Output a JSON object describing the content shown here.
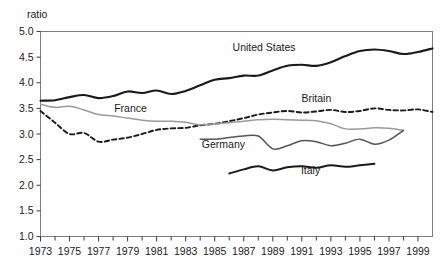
{
  "chart_data": {
    "type": "line",
    "title": "",
    "subtitle": "",
    "xlabel": "",
    "ylabel": "ratio",
    "ylabel_position": "top-left",
    "xlim": [
      1973,
      2000
    ],
    "ylim": [
      1.0,
      5.0
    ],
    "grid": false,
    "legend": "inline-annotations",
    "y_ticks": [
      "1.0",
      "1.5",
      "2.0",
      "2.5",
      "3.0",
      "3.5",
      "4.0",
      "4.5",
      "5.0"
    ],
    "y_tick_values": [
      1.0,
      1.5,
      2.0,
      2.5,
      3.0,
      3.5,
      4.0,
      4.5,
      5.0
    ],
    "x_ticks_major": [
      "1973",
      "1975",
      "1977",
      "1979",
      "1981",
      "1983",
      "1985",
      "1987",
      "1989",
      "1991",
      "1993",
      "1995",
      "1997",
      "1999"
    ],
    "x_tick_values_major": [
      1973,
      1975,
      1977,
      1979,
      1981,
      1983,
      1985,
      1987,
      1989,
      1991,
      1993,
      1995,
      1997,
      1999
    ],
    "x_ticks_minor": [
      1974,
      1976,
      1978,
      1980,
      1982,
      1984,
      1986,
      1988,
      1990,
      1992,
      1994,
      1996,
      1998
    ],
    "series": [
      {
        "name": "United States",
        "label": "United States",
        "color": "#1a1a1a",
        "style": "solid",
        "width": 2.1,
        "label_x": 1988.4,
        "label_y": 4.62,
        "x": [
          1973,
          1974,
          1975,
          1976,
          1977,
          1978,
          1979,
          1980,
          1981,
          1982,
          1983,
          1984,
          1985,
          1986,
          1987,
          1988,
          1989,
          1990,
          1991,
          1992,
          1993,
          1994,
          1995,
          1996,
          1997,
          1998,
          1999,
          2000
        ],
        "values": [
          3.65,
          3.66,
          3.72,
          3.76,
          3.7,
          3.74,
          3.83,
          3.8,
          3.85,
          3.78,
          3.84,
          3.95,
          4.06,
          4.09,
          4.14,
          4.14,
          4.24,
          4.33,
          4.35,
          4.33,
          4.4,
          4.52,
          4.62,
          4.65,
          4.62,
          4.56,
          4.6,
          4.67
        ]
      },
      {
        "name": "Britain",
        "label": "Britain",
        "color": "#1a1a1a",
        "style": "dashed",
        "width": 1.9,
        "label_x": 1992.0,
        "label_y": 3.62,
        "x": [
          1973,
          1974,
          1975,
          1976,
          1977,
          1978,
          1979,
          1980,
          1981,
          1982,
          1983,
          1984,
          1985,
          1986,
          1987,
          1988,
          1989,
          1990,
          1991,
          1992,
          1993,
          1994,
          1995,
          1996,
          1997,
          1998,
          1999,
          2000
        ],
        "values": [
          3.45,
          3.22,
          3.0,
          3.02,
          2.85,
          2.89,
          2.93,
          3.0,
          3.08,
          3.11,
          3.12,
          3.17,
          3.2,
          3.25,
          3.31,
          3.38,
          3.42,
          3.45,
          3.42,
          3.44,
          3.47,
          3.43,
          3.45,
          3.5,
          3.47,
          3.46,
          3.48,
          3.43
        ]
      },
      {
        "name": "France",
        "label": "France",
        "color": "#9a9a9a",
        "style": "solid",
        "width": 1.5,
        "label_x": 1979.2,
        "label_y": 3.43,
        "x": [
          1973,
          1974,
          1975,
          1976,
          1977,
          1978,
          1979,
          1980,
          1981,
          1982,
          1983,
          1984,
          1985,
          1986,
          1987,
          1988,
          1989,
          1990,
          1991,
          1992,
          1993,
          1994,
          1995,
          1996,
          1997,
          1998
        ],
        "values": [
          3.58,
          3.52,
          3.54,
          3.47,
          3.38,
          3.35,
          3.31,
          3.27,
          3.25,
          3.25,
          3.23,
          3.18,
          3.2,
          3.22,
          3.25,
          3.28,
          3.29,
          3.28,
          3.27,
          3.26,
          3.2,
          3.1,
          3.1,
          3.12,
          3.11,
          3.07
        ]
      },
      {
        "name": "Germany",
        "label": "Germany",
        "color": "#555555",
        "style": "solid",
        "width": 1.5,
        "label_x": 1985.6,
        "label_y": 2.72,
        "x": [
          1984,
          1985,
          1986,
          1987,
          1988,
          1989,
          1990,
          1991,
          1992,
          1993,
          1994,
          1995,
          1996,
          1997,
          1998
        ],
        "values": [
          2.9,
          2.9,
          2.93,
          2.96,
          2.96,
          2.71,
          2.77,
          2.87,
          2.85,
          2.77,
          2.82,
          2.9,
          2.8,
          2.88,
          3.07
        ]
      },
      {
        "name": "Italy",
        "label": "Italy",
        "color": "#1a1a1a",
        "style": "solid",
        "width": 2.0,
        "label_x": 1991.6,
        "label_y": 2.22,
        "x": [
          1986,
          1987,
          1988,
          1989,
          1990,
          1991,
          1992,
          1993,
          1994,
          1995,
          1996
        ],
        "values": [
          2.23,
          2.31,
          2.37,
          2.29,
          2.35,
          2.37,
          2.34,
          2.39,
          2.36,
          2.39,
          2.42
        ]
      }
    ]
  },
  "axes": {
    "y_axis_unit_label": "ratio"
  }
}
